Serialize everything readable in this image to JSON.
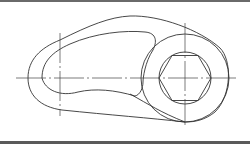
{
  "drawing": {
    "type": "mechanical part outline (cam / lever with hexagonal bore)",
    "stroke_color": "#333333",
    "centerline_color": "#444444",
    "background": "#ffffff",
    "border_color": "#5a5a5a",
    "features": {
      "outer_contour": "cam-shaped outline",
      "inner_slot": "curved kidney-shaped cutout",
      "boss_circle": {
        "cx": 185,
        "cy": 78,
        "r": 44
      },
      "bore_circle": {
        "cx": 185,
        "cy": 78,
        "r": 26
      },
      "hexagon": {
        "cx": 185,
        "cy": 78,
        "circumradius": 26
      },
      "centerlines": [
        "horizontal",
        "vertical-left",
        "vertical-right"
      ]
    }
  }
}
